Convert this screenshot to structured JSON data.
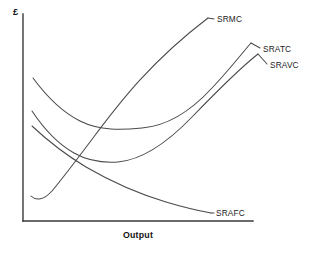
{
  "chart_data": {
    "type": "line",
    "title": "",
    "subtitle": "",
    "xlabel": "Output",
    "ylabel": "£",
    "grid": false,
    "legend_position": "inline-curve-labels",
    "axis_ranges": {
      "x": [
        0,
        1
      ],
      "y": [
        0,
        1
      ],
      "note": "Axes are qualitative — no numeric tick labels are shown."
    },
    "xticks": [],
    "yticks": [],
    "annotations": [],
    "series": [
      {
        "name": "SRMC",
        "label": "SRMC",
        "description": "Short-run marginal cost: dips slightly then rises steeply, cutting SRAVC and SRATC at their minimum points.",
        "x": [
          0.035,
          0.075,
          0.12,
          0.17,
          0.22,
          0.28,
          0.34,
          0.392,
          0.445,
          0.51,
          0.58,
          0.66,
          0.74,
          0.805
        ],
        "y": [
          0.155,
          0.12,
          0.128,
          0.165,
          0.225,
          0.3,
          0.385,
          0.455,
          0.53,
          0.615,
          0.705,
          0.805,
          0.9,
          0.972
        ],
        "path": "M 31,196 C 36,201 44,200 52,191 C 63,178 78,158 96,134 C 118,105 150,62 208,18"
      },
      {
        "name": "SRATC",
        "label": "SRATC",
        "description": "Short-run average total cost: U-shaped, minimum at a higher output than SRAVC, lies above SRAVC everywhere.",
        "x": [
          0.05,
          0.09,
          0.14,
          0.2,
          0.27,
          0.34,
          0.41,
          0.47,
          0.53,
          0.61,
          0.7,
          0.8,
          0.9,
          0.985
        ],
        "y": [
          0.695,
          0.628,
          0.568,
          0.52,
          0.487,
          0.47,
          0.466,
          0.475,
          0.495,
          0.535,
          0.6,
          0.685,
          0.785,
          0.88
        ],
        "path": "M 33,78 C 47,97 62,112 80,121 C 100,131 122,130 142,128 C 166,126 190,112 212,88 C 230,69 243,52 251,43"
      },
      {
        "name": "SRAVC",
        "label": "SRAVC",
        "description": "Short-run average variable cost: U-shaped, minimum at a lower output than SRATC, converges toward SRATC as output rises.",
        "x": [
          0.05,
          0.095,
          0.15,
          0.215,
          0.285,
          0.35,
          0.415,
          0.48,
          0.555,
          0.64,
          0.73,
          0.83,
          0.93,
          1.0
        ],
        "y": [
          0.52,
          0.45,
          0.395,
          0.355,
          0.33,
          0.322,
          0.328,
          0.345,
          0.378,
          0.425,
          0.49,
          0.57,
          0.66,
          0.73
        ],
        "path": "M 32,111 C 44,129 58,144 74,153 C 90,162 104,163 118,162 C 140,160 166,144 192,117 C 222,86 244,65 258,54"
      },
      {
        "name": "SRAFC",
        "label": "SRAFC",
        "description": "Short-run average fixed cost: a rectangular hyperbola falling continuously toward the output axis.",
        "x": [
          0.04,
          0.08,
          0.13,
          0.19,
          0.26,
          0.33,
          0.41,
          0.49,
          0.57,
          0.65,
          0.73,
          0.81
        ],
        "y": [
          0.495,
          0.43,
          0.365,
          0.305,
          0.252,
          0.212,
          0.178,
          0.152,
          0.13,
          0.114,
          0.102,
          0.094
        ],
        "path": "M 32,126 C 48,141 66,155 86,167 C 110,181 136,193 166,202 C 186,208 200,211 211,213"
      }
    ]
  },
  "axes": {
    "y_label": "£",
    "x_label": "Output"
  },
  "labels": {
    "srmc": "SRMC",
    "sratc": "SRATC",
    "sravc": "SRAVC",
    "srafc": "SRAFC"
  },
  "colors": {
    "background": "#ffffff",
    "axis": "#3a3a3a",
    "curve": "#4a4a4a",
    "text": "#111111"
  }
}
